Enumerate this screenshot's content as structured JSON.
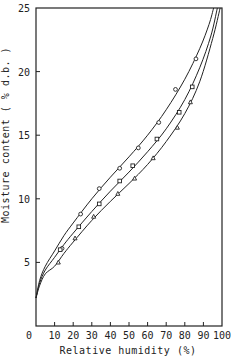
{
  "chart_data": {
    "type": "line",
    "title": "",
    "xlabel": "Relative humidity (%)",
    "ylabel": "Moisture content ( % d.b. )",
    "xlim": [
      0,
      100
    ],
    "ylim": [
      0,
      25
    ],
    "x_ticks": [
      0,
      10,
      20,
      30,
      40,
      50,
      60,
      70,
      80,
      90,
      100
    ],
    "y_ticks": [
      0,
      5,
      10,
      15,
      20,
      25
    ],
    "grid": false,
    "legend": null,
    "series": [
      {
        "name": "upper",
        "marker": "circle",
        "points": [
          [
            14,
            6.1
          ],
          [
            24,
            8.8
          ],
          [
            34,
            10.8
          ],
          [
            45,
            12.4
          ],
          [
            55,
            14.0
          ],
          [
            66,
            16.0
          ],
          [
            75,
            18.6
          ],
          [
            86,
            21.0
          ]
        ],
        "curve": [
          [
            0,
            2.2
          ],
          [
            2,
            3.6
          ],
          [
            5,
            4.7
          ],
          [
            10,
            5.9
          ],
          [
            15,
            7.1
          ],
          [
            20,
            8.1
          ],
          [
            30,
            10.0
          ],
          [
            40,
            11.7
          ],
          [
            50,
            13.3
          ],
          [
            60,
            15.0
          ],
          [
            70,
            17.0
          ],
          [
            80,
            19.4
          ],
          [
            88,
            21.8
          ],
          [
            93,
            23.7
          ],
          [
            95.5,
            25
          ]
        ]
      },
      {
        "name": "middle",
        "marker": "square",
        "points": [
          [
            13,
            6.0
          ],
          [
            23,
            7.8
          ],
          [
            34,
            9.6
          ],
          [
            45,
            11.4
          ],
          [
            52,
            12.6
          ],
          [
            65,
            14.7
          ],
          [
            77,
            16.8
          ],
          [
            84,
            18.8
          ]
        ],
        "curve": [
          [
            0,
            2.2
          ],
          [
            2,
            3.4
          ],
          [
            5,
            4.4
          ],
          [
            10,
            5.4
          ],
          [
            15,
            6.4
          ],
          [
            20,
            7.3
          ],
          [
            30,
            9.0
          ],
          [
            40,
            10.6
          ],
          [
            50,
            12.1
          ],
          [
            60,
            13.7
          ],
          [
            70,
            15.5
          ],
          [
            80,
            17.8
          ],
          [
            88,
            20.3
          ],
          [
            94,
            22.8
          ],
          [
            97.5,
            25
          ]
        ]
      },
      {
        "name": "lower",
        "marker": "triangle",
        "points": [
          [
            12,
            5.0
          ],
          [
            21,
            6.9
          ],
          [
            31,
            8.6
          ],
          [
            44,
            10.4
          ],
          [
            53,
            11.6
          ],
          [
            63,
            13.2
          ],
          [
            76,
            15.6
          ],
          [
            83,
            17.6
          ]
        ],
        "curve": [
          [
            0,
            2.2
          ],
          [
            2,
            3.2
          ],
          [
            5,
            4.1
          ],
          [
            10,
            4.7
          ],
          [
            15,
            5.7
          ],
          [
            20,
            6.6
          ],
          [
            30,
            8.3
          ],
          [
            40,
            9.8
          ],
          [
            50,
            11.2
          ],
          [
            60,
            12.7
          ],
          [
            70,
            14.5
          ],
          [
            80,
            16.7
          ],
          [
            88,
            19.2
          ],
          [
            95,
            22.6
          ],
          [
            99,
            25
          ]
        ]
      }
    ]
  }
}
